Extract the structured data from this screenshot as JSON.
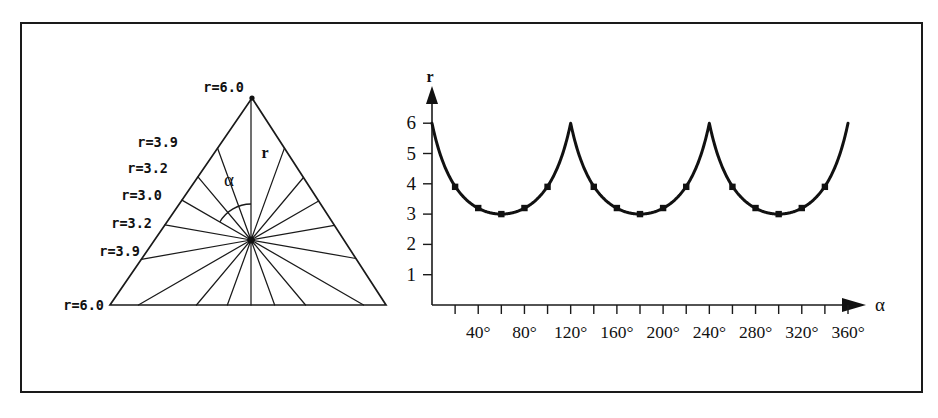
{
  "figure": {
    "width": 938,
    "height": 418,
    "background": "#ffffff",
    "ink": "#111111",
    "border_color": "#1a1a1a"
  },
  "triangle_panel": {
    "name": "equilateral-triangle-radius-diagram",
    "apex_label": "r=6.0",
    "left_labels": [
      "r=3.9",
      "r=3.2",
      "r=3.0",
      "r=3.2",
      "r=3.9"
    ],
    "bottom_left_label": "r=6.0",
    "radius_symbol": "r",
    "angle_symbol": "α",
    "ray_count": 18,
    "ray_step_degrees": 20,
    "geometry": {
      "apex": [
        252,
        98
      ],
      "bottom_left": [
        110,
        305
      ],
      "bottom_right": [
        386,
        305
      ],
      "center": [
        251,
        240
      ]
    },
    "label_values": [
      6.0,
      3.9,
      3.2,
      3.0,
      3.2,
      3.9,
      6.0
    ]
  },
  "chart_panel": {
    "name": "radius-vs-angle-plot",
    "axis": {
      "x_symbol": "α",
      "y_symbol": "r"
    }
  },
  "chart_data": {
    "type": "line",
    "title": "",
    "xlabel": "α",
    "ylabel": "r",
    "grid": false,
    "legend": null,
    "xlim": [
      0,
      360
    ],
    "ylim": [
      0,
      6.4
    ],
    "x_tick_step_degrees": 20,
    "x_tick_values": [
      20,
      40,
      60,
      80,
      100,
      120,
      140,
      160,
      180,
      200,
      220,
      240,
      260,
      280,
      300,
      320,
      340,
      360
    ],
    "x_tick_labels": [
      "40°",
      "80°",
      "120°",
      "160°",
      "200°",
      "240°",
      "280°",
      "320°",
      "360°"
    ],
    "x_labelled_values": [
      40,
      80,
      120,
      160,
      200,
      240,
      280,
      320,
      360
    ],
    "y_tick_labels": [
      "1",
      "2",
      "3",
      "4",
      "5",
      "6"
    ],
    "y_tick_values": [
      1,
      2,
      3,
      4,
      5,
      6
    ],
    "marker_style": "filled-square",
    "series": [
      {
        "name": "r(α)",
        "x": [
          0,
          20,
          40,
          60,
          80,
          100,
          120,
          140,
          160,
          180,
          200,
          220,
          240,
          260,
          280,
          300,
          320,
          340,
          360
        ],
        "values": [
          6.0,
          3.9,
          3.2,
          3.0,
          3.2,
          3.9,
          6.0,
          3.9,
          3.2,
          3.0,
          3.2,
          3.9,
          6.0,
          3.9,
          3.2,
          3.0,
          3.2,
          3.9,
          6.0
        ]
      }
    ],
    "marker_x": [
      20,
      40,
      60,
      80,
      100,
      140,
      160,
      180,
      200,
      220,
      260,
      280,
      300,
      320,
      340
    ],
    "marker_values": [
      3.9,
      3.2,
      3.0,
      3.2,
      3.9,
      3.9,
      3.2,
      3.0,
      3.2,
      3.9,
      3.9,
      3.2,
      3.0,
      3.2,
      3.9
    ],
    "period_degrees": 120,
    "peaks_at": [
      0,
      120,
      240,
      360
    ],
    "minima_at": [
      60,
      180,
      300
    ]
  }
}
